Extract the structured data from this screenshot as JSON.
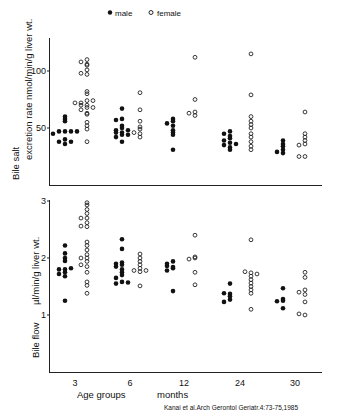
{
  "chart_data": [
    {
      "type": "scatter",
      "title": "",
      "legend": [
        {
          "label": "male",
          "marker": "filled-circle"
        },
        {
          "label": "female",
          "marker": "open-circle"
        }
      ],
      "legend_position": "top",
      "xlabel": "Age groups        months",
      "ylabel": "Bile salt excretion rate  nmol/min/g liver wt.",
      "categories": [
        "3",
        "6",
        "12",
        "24",
        "30"
      ],
      "yticks": [
        50,
        100
      ],
      "ylim": [
        0,
        125
      ],
      "grid": false,
      "series": [
        {
          "name": "male",
          "values": [
            [
              47,
              47,
              47,
              58,
              60,
              56,
              40,
              38,
              36,
              45,
              47,
              38
            ],
            [
              67,
              58,
              52,
              50,
              48,
              46,
              44,
              42,
              38,
              57,
              48,
              46,
              44
            ],
            [
              58,
              56,
              54,
              52,
              48,
              46,
              44,
              31
            ],
            [
              47,
              45,
              43,
              41,
              39,
              37,
              35,
              33,
              31,
              36
            ],
            [
              39,
              36,
              34,
              31,
              29,
              28
            ]
          ]
        },
        {
          "name": "female",
          "values": [
            [
              106,
              97,
              63,
              38,
              110,
              108,
              105,
              101,
              98,
              82,
              80,
              74,
              72,
              70,
              68,
              66,
              62,
              55,
              52,
              49,
              74,
              72,
              70,
              68
            ],
            [
              81,
              66,
              56,
              51,
              49,
              45,
              42,
              46
            ],
            [
              112,
              75,
              64,
              63,
              61
            ],
            [
              115,
              79,
              60,
              56,
              53,
              50,
              45,
              42,
              38,
              34,
              31
            ],
            [
              64,
              45,
              42,
              39,
              36,
              35,
              25,
              25
            ]
          ]
        }
      ]
    },
    {
      "type": "scatter",
      "title": "",
      "xlabel": "Age groups        months",
      "ylabel": "Bile flow  µl/min/g liver wt.",
      "categories": [
        "3",
        "6",
        "12",
        "24",
        "30"
      ],
      "yticks": [
        1,
        2,
        3
      ],
      "ylim": [
        0,
        3.05
      ],
      "grid": false,
      "series": [
        {
          "name": "male",
          "values": [
            [
              1.8,
              1.8,
              1.82,
              2.22,
              2.08,
              2.0,
              1.95,
              1.75,
              1.72,
              1.68,
              1.25
            ],
            [
              2.33,
              2.16,
              1.92,
              1.88,
              1.85,
              1.8,
              1.75,
              1.7,
              1.65,
              1.58,
              1.55,
              1.9,
              1.57
            ],
            [
              1.84,
              1.94,
              1.9,
              1.86,
              1.82,
              1.78,
              1.42
            ],
            [
              1.37,
              1.55,
              1.38,
              1.33,
              1.27,
              1.23
            ],
            [
              1.25,
              1.47,
              1.28,
              1.24,
              1.12
            ]
          ]
        },
        {
          "name": "female",
          "values": [
            [
              2.7,
              2.55,
              2.0,
              1.85,
              2.97,
              2.93,
              2.85,
              2.78,
              2.7,
              2.62,
              2.56,
              2.28,
              2.22,
              2.14,
              2.06,
              2.0,
              1.94,
              1.88,
              1.75,
              1.58,
              1.52,
              1.38
            ],
            [
              1.76,
              2.07,
              2.0,
              1.94,
              1.88,
              1.82,
              1.78,
              1.51,
              1.78
            ],
            [
              2.0,
              2.4,
              2.02,
              1.98,
              1.75,
              1.53
            ],
            [
              1.74,
              2.32,
              1.76,
              1.72,
              1.68,
              1.62,
              1.56,
              1.5,
              1.44,
              1.38,
              1.1
            ],
            [
              1.0,
              1.75,
              1.66,
              1.44,
              1.4,
              1.36,
              1.23,
              1.02
            ]
          ]
        }
      ]
    }
  ],
  "labels": {
    "legend_male": "male",
    "legend_female": "female",
    "top_ylabel_1": "Bile salt",
    "top_ylabel_2": "excretion rate",
    "top_unit": "nmol/min/g liver wt.",
    "bottom_ylabel_1": "Bile flow",
    "bottom_unit": "µl/min/g liver wt.",
    "top_tick_100": "100",
    "top_tick_50": "50",
    "bottom_tick_3": "3",
    "bottom_tick_2": "2",
    "bottom_tick_1": "1",
    "x_ticks": [
      "3",
      "6",
      "12",
      "24",
      "30"
    ],
    "xlabel_left": "Age groups",
    "xlabel_right": "months",
    "citation": "Kanai et  al.Arch Gerontol Geriatr.4:73-75,1985"
  }
}
